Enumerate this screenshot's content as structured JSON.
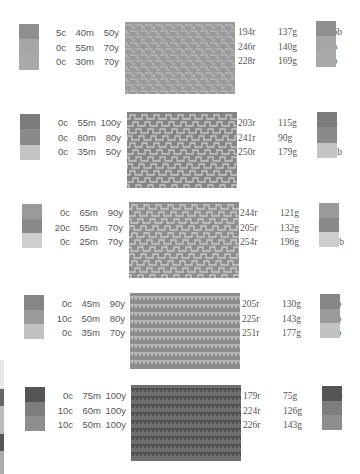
{
  "palettes": [
    {
      "cmyk": [
        {
          "c": "5c",
          "m": "40m",
          "y": "50y",
          "k": "20k"
        },
        {
          "c": "0c",
          "m": "55m",
          "y": "70y",
          "k": "0k"
        },
        {
          "c": "0c",
          "m": "30m",
          "y": "70y",
          "k": "10k"
        }
      ],
      "rgb": [
        {
          "r": "194r",
          "g": "137g",
          "b": "106b"
        },
        {
          "r": "246r",
          "g": "140g",
          "b": "89b"
        },
        {
          "r": "228r",
          "g": "169g",
          "b": "90b"
        }
      ],
      "swatch_colors": [
        "#8f8f8f",
        "#a6a6a6",
        "#a9a9a9"
      ],
      "pattern": {
        "name": "brick-weave",
        "base": "#9a9a9a",
        "line": "#b4b4b4"
      }
    },
    {
      "cmyk": [
        {
          "c": "0c",
          "m": "55m",
          "y": "100y",
          "k": "20k"
        },
        {
          "c": "0c",
          "m": "80m",
          "y": "80y",
          "k": "0k"
        },
        {
          "c": "0c",
          "m": "35m",
          "y": "50y",
          "k": "0k"
        }
      ],
      "rgb": [
        {
          "r": "203r",
          "g": "115g",
          "b": "23b"
        },
        {
          "r": "241r",
          "g": "90g",
          "b": "64b"
        },
        {
          "r": "250r",
          "g": "179g",
          "b": "131b"
        }
      ],
      "swatch_colors": [
        "#7c7c7c",
        "#8a8a8a",
        "#c4c4c4"
      ],
      "pattern": {
        "name": "step-weave",
        "base": "#858585",
        "line": "#c6c6c6"
      }
    },
    {
      "cmyk": [
        {
          "c": "0c",
          "m": "65m",
          "y": "90y",
          "k": "0k"
        },
        {
          "c": "20c",
          "m": "55m",
          "y": "70y",
          "k": "0k"
        },
        {
          "c": "0c",
          "m": "25m",
          "y": "70y",
          "k": "0k"
        }
      ],
      "rgb": [
        {
          "r": "244r",
          "g": "121g",
          "b": "50b"
        },
        {
          "r": "205r",
          "g": "132g",
          "b": "92b"
        },
        {
          "r": "254r",
          "g": "196g",
          "b": "101b"
        }
      ],
      "swatch_colors": [
        "#9a9a9a",
        "#8a8a8a",
        "#cdcdcd"
      ],
      "pattern": {
        "name": "step-weave",
        "base": "#8e8e8e",
        "line": "#c9c9c9"
      }
    },
    {
      "cmyk": [
        {
          "c": "0c",
          "m": "45m",
          "y": "90y",
          "k": "20k"
        },
        {
          "c": "10c",
          "m": "50m",
          "y": "80y",
          "k": "0k"
        },
        {
          "c": "0c",
          "m": "35m",
          "y": "70y",
          "k": "0k"
        }
      ],
      "rgb": [
        {
          "r": "205r",
          "g": "130g",
          "b": "42b"
        },
        {
          "r": "225r",
          "g": "143g",
          "b": "75b"
        },
        {
          "r": "251r",
          "g": "177g",
          "b": "97b"
        }
      ],
      "swatch_colors": [
        "#868686",
        "#9a9a9a",
        "#c2c2c2"
      ],
      "pattern": {
        "name": "comb-weave",
        "base": "#8d8d8d",
        "line": "#c0c0c0"
      }
    },
    {
      "cmyk": [
        {
          "c": "0c",
          "m": "75m",
          "y": "100y",
          "k": "30k"
        },
        {
          "c": "10c",
          "m": "60m",
          "y": "100y",
          "k": "0k"
        },
        {
          "c": "10c",
          "m": "50m",
          "y": "100y",
          "k": "0k"
        }
      ],
      "rgb": [
        {
          "r": "179r",
          "g": "75g",
          "b": "20b"
        },
        {
          "r": "224r",
          "g": "126g",
          "b": "39b"
        },
        {
          "r": "226r",
          "g": "143g",
          "b": "38b"
        }
      ],
      "swatch_colors": [
        "#555555",
        "#7e7e7e",
        "#8e8e8e"
      ],
      "pattern": {
        "name": "comb-weave",
        "base": "#6e6e6e",
        "line": "#4a4a4a"
      }
    }
  ]
}
